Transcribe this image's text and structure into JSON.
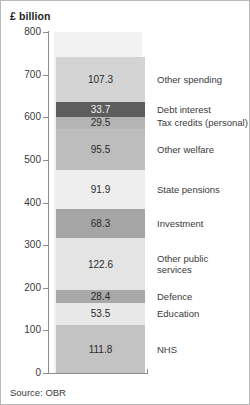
{
  "unit_label": "£ billion",
  "source": "Source: OBR",
  "axis": {
    "ylabel": "£ billion",
    "ticks": [
      "800",
      "700",
      "600",
      "500",
      "400",
      "300",
      "200",
      "100",
      "0"
    ]
  },
  "chart_data": {
    "type": "bar",
    "title": "",
    "subtitle": "",
    "xlabel": "",
    "ylabel": "£ billion",
    "ylim": [
      0,
      800
    ],
    "grid": false,
    "legend_position": "right-inline",
    "stacked": true,
    "categories": [
      ""
    ],
    "total": 742.5,
    "source": "Source: OBR",
    "series": [
      {
        "name": "Other spending",
        "value": 107.3,
        "label": "107.3",
        "color": "#d4d4d4"
      },
      {
        "name": "Debt interest",
        "value": 33.7,
        "label": "33.7",
        "color": "#5d5d5d"
      },
      {
        "name": "Tax credits (personal)",
        "value": 29.5,
        "label": "29.5",
        "color": "#b4b4b4"
      },
      {
        "name": "Other welfare",
        "value": 95.5,
        "label": "95.5",
        "color": "#bdbdbd"
      },
      {
        "name": "State pensions",
        "value": 91.9,
        "label": "91.9",
        "color": "#eeeeee"
      },
      {
        "name": "Investment",
        "value": 68.3,
        "label": "68.3",
        "color": "#a5a5a5"
      },
      {
        "name": "Other public\nservices",
        "value": 122.6,
        "label": "122.6",
        "color": "#e4e4e4"
      },
      {
        "name": "Defence",
        "value": 28.4,
        "label": "28.4",
        "color": "#a8a8a8"
      },
      {
        "name": "Education",
        "value": 53.5,
        "label": "53.5",
        "color": "#e8e8e8"
      },
      {
        "name": "NHS",
        "value": 111.8,
        "label": "111.8",
        "color": "#c3c3c3"
      }
    ]
  }
}
